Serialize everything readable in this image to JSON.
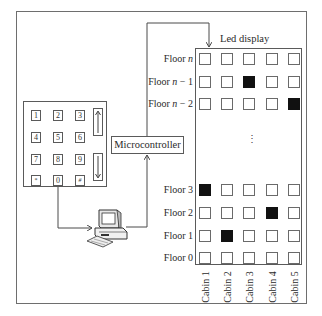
{
  "diagram": {
    "keypad": {
      "keys": [
        "1",
        "2",
        "3",
        "4",
        "5",
        "6",
        "7",
        "8",
        "9",
        "*",
        "0",
        "#"
      ],
      "arrows": [
        "up-arrow",
        "down-arrow"
      ]
    },
    "microcontroller_label": "Microcontroller",
    "computer_label": "",
    "led_display": {
      "title": "Led display",
      "floors": [
        {
          "label_prefix": "Floor ",
          "label_var": "n",
          "label_suffix": "",
          "leds": [
            0,
            0,
            0,
            0,
            0
          ]
        },
        {
          "label_prefix": "Floor ",
          "label_var": "n",
          "label_suffix": " − 1",
          "leds": [
            0,
            0,
            1,
            0,
            0
          ]
        },
        {
          "label_prefix": "Floor ",
          "label_var": "n",
          "label_suffix": " − 2",
          "leds": [
            0,
            0,
            0,
            0,
            1
          ]
        },
        {
          "label_prefix": "Floor 3",
          "label_var": "",
          "label_suffix": "",
          "leds": [
            1,
            0,
            0,
            0,
            0
          ]
        },
        {
          "label_prefix": "Floor 2",
          "label_var": "",
          "label_suffix": "",
          "leds": [
            0,
            0,
            0,
            1,
            0
          ]
        },
        {
          "label_prefix": "Floor 1",
          "label_var": "",
          "label_suffix": "",
          "leds": [
            0,
            1,
            0,
            0,
            0
          ]
        },
        {
          "label_prefix": "Floor 0",
          "label_var": "",
          "label_suffix": "",
          "leds": [
            0,
            0,
            0,
            0,
            0
          ]
        }
      ],
      "ellipsis": "⋮",
      "cabins": [
        "Cabin 1",
        "Cabin 2",
        "Cabin 3",
        "Cabin 4",
        "Cabin 5"
      ]
    },
    "colors": {
      "line": "#4a4a4a",
      "led_on": "#111111",
      "led_off": "#ffffff"
    }
  }
}
